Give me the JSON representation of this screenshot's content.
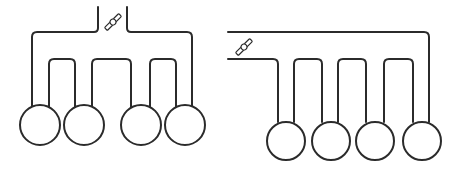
{
  "diagram": {
    "colors": {
      "line": "#2b2b2b",
      "background": "#ffffff"
    },
    "layouts": [
      {
        "name": "center-fed",
        "feed": "top-center",
        "valve_icon": "valve-icon",
        "tank_count": 4,
        "loop_count": 3
      },
      {
        "name": "side-fed",
        "feed": "left",
        "valve_icon": "valve-icon",
        "tank_count": 4,
        "loop_count": 3
      }
    ]
  }
}
